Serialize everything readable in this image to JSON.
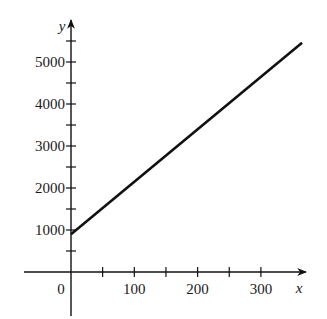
{
  "chart_data": {
    "type": "line",
    "title": "",
    "xlabel": "x",
    "ylabel": "y",
    "origin_label": "0",
    "x_ticks": [
      50,
      100,
      150,
      200,
      250,
      300
    ],
    "x_tick_labels": [
      "100",
      "200",
      "300"
    ],
    "x_tick_label_values": [
      100,
      200,
      300
    ],
    "y_ticks": [
      500,
      1000,
      1500,
      2000,
      2500,
      3000,
      3500,
      4000,
      4500,
      5000,
      5500
    ],
    "y_tick_labels": [
      "1000",
      "2000",
      "3000",
      "4000",
      "5000"
    ],
    "y_tick_label_values": [
      1000,
      2000,
      3000,
      4000,
      5000
    ],
    "xlim": [
      -50,
      370
    ],
    "ylim": [
      -600,
      5800
    ],
    "grid": false,
    "legend": null,
    "series": [
      {
        "name": "line",
        "x": [
          0,
          365
        ],
        "y": [
          900,
          5460
        ],
        "color": "#111111"
      }
    ]
  }
}
